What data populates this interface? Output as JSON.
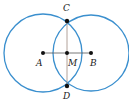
{
  "diagram": {
    "type": "perpendicular-bisector-construction",
    "colors": {
      "circle": "#3a8fce",
      "segment": "#333333",
      "bisector": "#a08a80",
      "point": "#111111"
    },
    "circles": [
      {
        "name": "circle-a",
        "center": "A",
        "cx": 43,
        "cy": 53,
        "r": 39
      },
      {
        "name": "circle-b",
        "center": "B",
        "cx": 91,
        "cy": 53,
        "r": 38
      }
    ],
    "points": [
      {
        "id": "A",
        "label": "A",
        "x": 43,
        "y": 53,
        "lx": 38,
        "ly": 66
      },
      {
        "id": "B",
        "label": "B",
        "x": 91,
        "y": 53,
        "lx": 91,
        "ly": 66
      },
      {
        "id": "M",
        "label": "M",
        "x": 67,
        "y": 53,
        "lx": 69,
        "ly": 66
      },
      {
        "id": "C",
        "label": "C",
        "x": 67,
        "y": 21,
        "lx": 63,
        "ly": 11
      },
      {
        "id": "D",
        "label": "D",
        "x": 67,
        "y": 86,
        "lx": 63,
        "ly": 99
      }
    ],
    "segments": [
      {
        "name": "segment-ab",
        "from": "A",
        "to": "B"
      },
      {
        "name": "segment-cd",
        "from": "C",
        "to": "D"
      }
    ],
    "labels": {
      "A": "A",
      "B": "B",
      "C": "C",
      "D": "D",
      "M": "M"
    }
  }
}
